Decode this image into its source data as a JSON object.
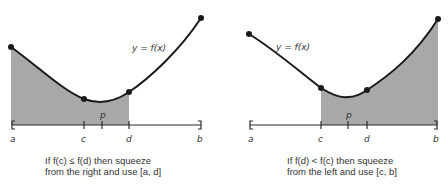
{
  "colors": {
    "curve": "#1a1a1a",
    "shade": "#a8a8a8",
    "axis": "#2a2a2a",
    "text": "#333333"
  },
  "left_panel": {
    "function_label": "y = f(x)",
    "tick_labels": {
      "a": "a",
      "c": "c",
      "p": "p",
      "d": "d",
      "b": "b"
    },
    "shaded_interval": "[a, d]",
    "caption": {
      "line1": "If f(c) ≤ f(d) then squeeze",
      "line2": "from the right and use [a, d]"
    }
  },
  "right_panel": {
    "function_label": "y = f(x)",
    "tick_labels": {
      "a": "a",
      "c": "c",
      "p": "p",
      "d": "d",
      "b": "b"
    },
    "shaded_interval": "[c, b]",
    "caption": {
      "line1": "If f(d) < f(c) then squeeze",
      "line2": "from the left and use [c, b]"
    }
  }
}
